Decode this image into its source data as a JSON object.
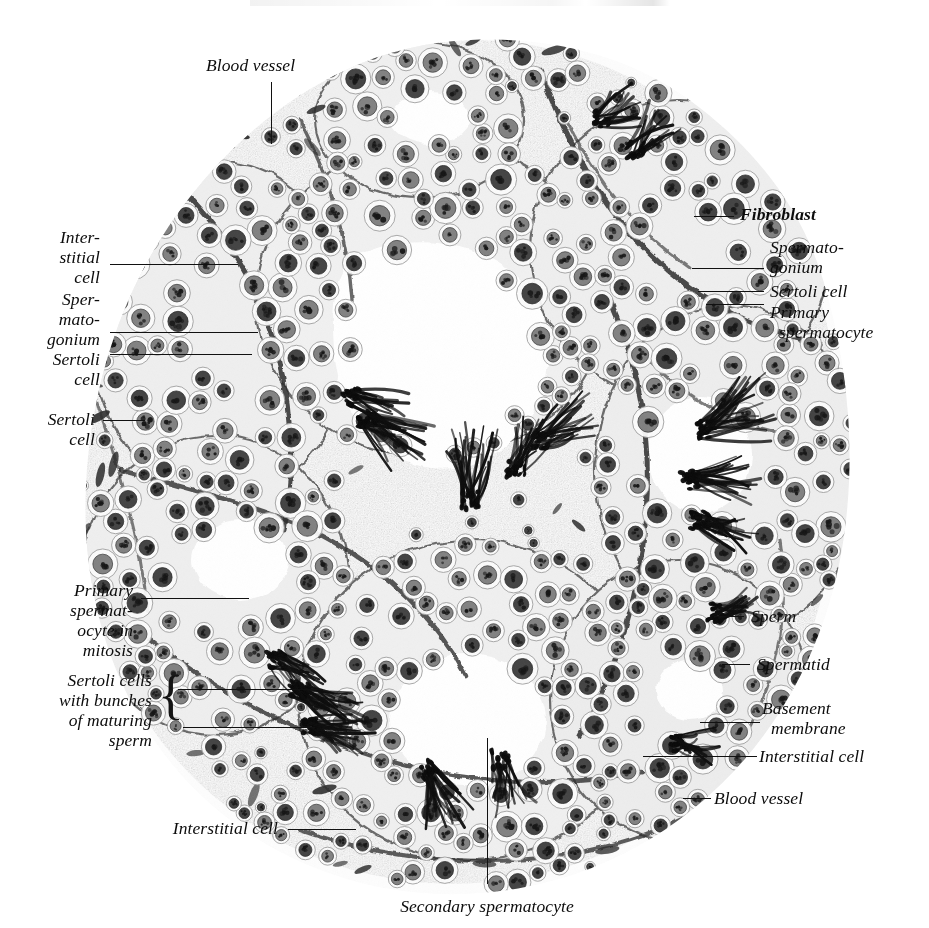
{
  "figure": {
    "kind": "histology-plate",
    "background_color": "#ffffff",
    "ink_color": "#111111"
  },
  "labels": [
    {
      "id": "blood-vessel-top",
      "text": "Blood vessel",
      "align": "left",
      "bold": false
    },
    {
      "id": "interstitial-cell-left",
      "text": "Inter-\nstitial\ncell",
      "align": "right",
      "bold": false
    },
    {
      "id": "spermatogonium-left",
      "text": "Sper-\nmato-\ngonium",
      "align": "right",
      "bold": false
    },
    {
      "id": "sertoli-cell-left-1",
      "text": "Sertoli\ncell",
      "align": "right",
      "bold": false
    },
    {
      "id": "sertoli-cell-left-2",
      "text": "Sertoli\ncell",
      "align": "right",
      "bold": false
    },
    {
      "id": "primary-spermatocyte-mitosis",
      "text": "Primary\nspermat-\nocyte in\nmitosis",
      "align": "right",
      "bold": false
    },
    {
      "id": "sertoli-cells-bunches",
      "text": "Sertoli cells\nwith bunches\nof maturing\nsperm",
      "align": "right",
      "bold": false
    },
    {
      "id": "interstitial-cell-bottom-left",
      "text": "Interstitial cell",
      "align": "right",
      "bold": false
    },
    {
      "id": "secondary-spermatocyte",
      "text": "Secondary spermatocyte",
      "align": "center",
      "bold": false
    },
    {
      "id": "fibroblast",
      "text": "Fibroblast",
      "align": "left",
      "bold": true
    },
    {
      "id": "spermatogonium-right",
      "text": "Spermato-\ngonium",
      "align": "left",
      "bold": false
    },
    {
      "id": "sertoli-cell-right",
      "text": "Sertoli cell",
      "align": "left",
      "bold": false
    },
    {
      "id": "primary-spermatocyte-right",
      "text": "Primary\n  spermatocyte",
      "align": "left",
      "bold": false
    },
    {
      "id": "sperm",
      "text": "Sperm",
      "align": "left",
      "bold": false
    },
    {
      "id": "spermatid",
      "text": "Spermatid",
      "align": "left",
      "bold": false
    },
    {
      "id": "basement-membrane",
      "text": "Basement\n  membrane",
      "align": "left",
      "bold": false
    },
    {
      "id": "interstitial-cell-right",
      "text": "Interstitial cell",
      "align": "left",
      "bold": false
    },
    {
      "id": "blood-vessel-bottom-right",
      "text": "Blood vessel",
      "align": "left",
      "bold": false
    }
  ],
  "structures": [
    "seminiferous tubule",
    "tubule lumen",
    "basement membrane",
    "interstitial tissue",
    "spermatogonium",
    "primary spermatocyte",
    "secondary spermatocyte",
    "spermatid",
    "sperm",
    "Sertoli cell",
    "fibroblast",
    "blood vessel"
  ]
}
